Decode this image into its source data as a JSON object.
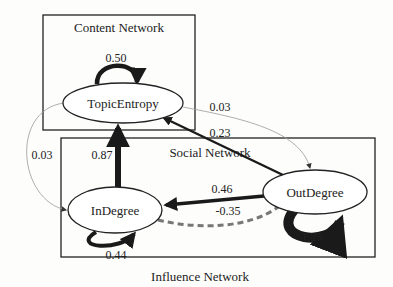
{
  "groups": {
    "content": {
      "label": "Content Network"
    },
    "social": {
      "label": "Social Network"
    },
    "influence": {
      "label": "Influence Network"
    }
  },
  "nodes": {
    "topic_entropy": {
      "label": "TopicEntropy"
    },
    "in_degree": {
      "label": "InDegree"
    },
    "out_degree": {
      "label": "OutDegree"
    }
  },
  "edges": {
    "te_self": {
      "from": "TopicEntropy",
      "to": "TopicEntropy",
      "weight": "0.50",
      "style": "solid"
    },
    "te_to_out": {
      "from": "TopicEntropy",
      "to": "OutDegree",
      "weight": "0.03",
      "style": "thin"
    },
    "out_to_te": {
      "from": "OutDegree",
      "to": "TopicEntropy",
      "weight": "0.23",
      "style": "solid"
    },
    "te_to_in": {
      "from": "TopicEntropy",
      "to": "InDegree",
      "weight": "0.03",
      "style": "thin"
    },
    "in_to_te": {
      "from": "InDegree",
      "to": "TopicEntropy",
      "weight": "0.87",
      "style": "thick"
    },
    "out_to_in": {
      "from": "OutDegree",
      "to": "InDegree",
      "weight": "0.46",
      "style": "solid"
    },
    "in_to_out_neg": {
      "from": "InDegree",
      "to": "OutDegree",
      "weight": "-0.35",
      "style": "dashed"
    },
    "in_self": {
      "from": "InDegree",
      "to": "InDegree",
      "weight": "0.44",
      "style": "solid"
    },
    "out_self": {
      "from": "OutDegree",
      "to": "OutDegree",
      "weight": "1.25",
      "style": "thick"
    }
  }
}
